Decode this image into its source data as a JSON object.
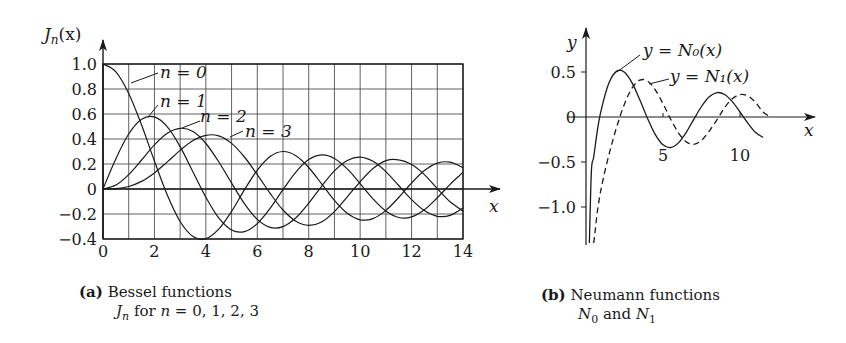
{
  "chart_data": [
    {
      "type": "line",
      "title": "Bessel functions J_n for n = 0, 1, 2, 3",
      "panel_label": "(a)",
      "xlabel": "x",
      "ylabel": "J_n(x)",
      "xlim": [
        0,
        14
      ],
      "ylim": [
        -0.4,
        1.0
      ],
      "grid": true,
      "xticks": [
        0,
        2,
        4,
        6,
        8,
        10,
        12,
        14
      ],
      "yticks": [
        1.0,
        0.8,
        0.6,
        0.4,
        0.2,
        0,
        -0.2,
        -0.4
      ],
      "ytick_labels": [
        "1.0",
        "0.8",
        "0.6",
        "0.4",
        "0.2",
        "0",
        "−0.2",
        "−0.4"
      ],
      "series": [
        {
          "name": "n = 0",
          "x": [
            0,
            0.5,
            1,
            1.5,
            2,
            2.5,
            3,
            3.5,
            4,
            4.5,
            5,
            5.5,
            6,
            6.5,
            7,
            7.5,
            8,
            8.5,
            9,
            9.5,
            10,
            10.5,
            11,
            11.5,
            12,
            12.5,
            13,
            13.5,
            14
          ],
          "values": [
            1.0,
            0.938,
            0.765,
            0.512,
            0.224,
            -0.048,
            -0.26,
            -0.38,
            -0.397,
            -0.321,
            -0.178,
            -0.007,
            0.151,
            0.26,
            0.3,
            0.266,
            0.172,
            0.042,
            -0.09,
            -0.194,
            -0.246,
            -0.237,
            -0.171,
            -0.068,
            0.048,
            0.147,
            0.207,
            0.215,
            0.171
          ]
        },
        {
          "name": "n = 1",
          "x": [
            0,
            0.5,
            1,
            1.5,
            2,
            2.5,
            3,
            3.5,
            4,
            4.5,
            5,
            5.5,
            6,
            6.5,
            7,
            7.5,
            8,
            8.5,
            9,
            9.5,
            10,
            10.5,
            11,
            11.5,
            12,
            12.5,
            13,
            13.5,
            14
          ],
          "values": [
            0,
            0.242,
            0.44,
            0.558,
            0.577,
            0.497,
            0.339,
            0.137,
            -0.066,
            -0.231,
            -0.328,
            -0.341,
            -0.277,
            -0.154,
            -0.005,
            0.135,
            0.235,
            0.273,
            0.245,
            0.161,
            0.043,
            -0.079,
            -0.177,
            -0.228,
            -0.223,
            -0.166,
            -0.07,
            0.038,
            0.133
          ]
        },
        {
          "name": "n = 2",
          "x": [
            0,
            0.5,
            1,
            1.5,
            2,
            2.5,
            3,
            3.5,
            4,
            4.5,
            5,
            5.5,
            6,
            6.5,
            7,
            7.5,
            8,
            8.5,
            9,
            9.5,
            10,
            10.5,
            11,
            11.5,
            12,
            12.5,
            13,
            13.5,
            14
          ],
          "values": [
            0,
            0.031,
            0.115,
            0.232,
            0.353,
            0.446,
            0.486,
            0.459,
            0.364,
            0.218,
            0.047,
            -0.117,
            -0.243,
            -0.307,
            -0.301,
            -0.23,
            -0.113,
            0.022,
            0.145,
            0.228,
            0.255,
            0.222,
            0.139,
            0.028,
            -0.085,
            -0.173,
            -0.218,
            -0.211,
            -0.152
          ]
        },
        {
          "name": "n = 3",
          "x": [
            0,
            0.5,
            1,
            1.5,
            2,
            2.5,
            3,
            3.5,
            4,
            4.5,
            5,
            5.5,
            6,
            6.5,
            7,
            7.5,
            8,
            8.5,
            9,
            9.5,
            10,
            10.5,
            11,
            11.5,
            12,
            12.5,
            13,
            13.5,
            14
          ],
          "values": [
            0,
            0.003,
            0.02,
            0.061,
            0.129,
            0.217,
            0.309,
            0.387,
            0.43,
            0.425,
            0.365,
            0.256,
            0.115,
            -0.035,
            -0.168,
            -0.258,
            -0.291,
            -0.264,
            -0.181,
            -0.062,
            0.058,
            0.164,
            0.227,
            0.233,
            0.195,
            0.115,
            0.003,
            -0.102,
            -0.177
          ]
        }
      ],
      "annotations": [
        "n = 0",
        "n = 1",
        "n = 2",
        "n = 3"
      ]
    },
    {
      "type": "line",
      "title": "Neumann functions N_0 and N_1",
      "panel_label": "(b)",
      "xlabel": "x",
      "ylabel": "y",
      "xlim": [
        0,
        12
      ],
      "ylim": [
        -1.4,
        0.6
      ],
      "grid": false,
      "xticks": [
        5,
        10
      ],
      "yticks": [
        0.5,
        0,
        -0.5,
        -1.0
      ],
      "ytick_labels": [
        "0.5",
        "0",
        "−0.5",
        "−1.0"
      ],
      "series": [
        {
          "name": "y = N₀(x)",
          "style": "solid",
          "x": [
            0.35,
            0.5,
            0.75,
            1,
            1.5,
            2,
            2.5,
            3,
            3.5,
            4,
            4.5,
            5,
            5.5,
            6,
            6.5,
            7,
            7.5,
            8,
            8.5,
            9,
            9.5,
            10,
            10.5,
            11,
            11.5
          ],
          "values": [
            -0.6,
            -0.444,
            -0.138,
            0.088,
            0.382,
            0.51,
            0.498,
            0.377,
            0.189,
            -0.017,
            -0.195,
            -0.309,
            -0.339,
            -0.288,
            -0.173,
            -0.026,
            0.117,
            0.224,
            0.271,
            0.25,
            0.171,
            0.056,
            -0.066,
            -0.169,
            -0.228
          ]
        },
        {
          "name": "y = N₁(x)",
          "style": "dashed",
          "x": [
            0.6,
            0.75,
            1,
            1.5,
            2,
            2.5,
            3,
            3.5,
            4,
            4.5,
            5,
            5.5,
            6,
            6.5,
            7,
            7.5,
            8,
            8.5,
            9,
            9.5,
            10,
            10.5,
            11,
            11.5,
            12
          ],
          "values": [
            -1.26,
            -1.04,
            -0.781,
            -0.412,
            -0.107,
            0.146,
            0.325,
            0.41,
            0.398,
            0.301,
            0.148,
            -0.024,
            -0.175,
            -0.274,
            -0.303,
            -0.259,
            -0.158,
            -0.032,
            0.104,
            0.203,
            0.249,
            0.235,
            0.164,
            0.055,
            0.0
          ]
        }
      ],
      "annotations": [
        "y = N₀(x)",
        "y = N₁(x)"
      ]
    }
  ],
  "panels": {
    "a": {
      "ylabel_main": "J",
      "ylabel_sub": "n",
      "ylabel_tail": "(x)",
      "xlabel": "x",
      "labels": {
        "n0": "n = 0",
        "n1": "n = 1",
        "n2": "n = 2",
        "n3": "n = 3"
      },
      "caption_tag": "(a)",
      "caption_line1": "Bessel functions",
      "caption_line2_var": "J",
      "caption_line2_sub": "n",
      "caption_line2_rest": " for ",
      "caption_line2_math": "n",
      "caption_line2_vals": " = 0, 1, 2, 3"
    },
    "b": {
      "ylabel": "y",
      "xlabel": "x",
      "label_n0": "y = N₀(x)",
      "label_n1": "y = N₁(x)",
      "caption_tag": "(b)",
      "caption_line1": "Neumann functions",
      "caption_n0": "N",
      "caption_n0_sub": "0",
      "caption_and": " and ",
      "caption_n1": "N",
      "caption_n1_sub": "1"
    }
  },
  "colors": {
    "ink": "#1a1a1a",
    "grid": "#3a3a3a"
  }
}
